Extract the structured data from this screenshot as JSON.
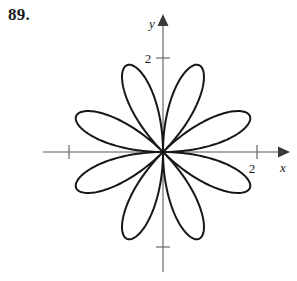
{
  "figure": {
    "problem_number": "89.",
    "background_color": "#ffffff",
    "curve_color": "#171717",
    "axis_color": "#595959",
    "text_color": "#1a1a1a"
  },
  "axes": {
    "x_axis_label": "x",
    "y_axis_label": "y",
    "x_tick_label": "2",
    "y_tick_label": "2",
    "x_tick_unlabeled_value": "-2",
    "y_tick_unlabeled_value": "-2",
    "origin_px": {
      "x": 163,
      "y": 152
    },
    "units_per_pixel": 47,
    "x_axis_start_px": 43,
    "x_axis_end_px": 282,
    "y_axis_start_px": 16,
    "y_axis_end_px": 272,
    "has_x_arrow": true,
    "has_y_arrow": true
  },
  "chart_data": {
    "type": "line",
    "subtype": "polar-rose",
    "title": "",
    "xlabel": "x",
    "ylabel": "y",
    "equation": "r = 2 sin(4θ)",
    "petal_count": 8,
    "amplitude": 2,
    "k": 4,
    "petal_angles_deg": [
      22.5,
      67.5,
      112.5,
      157.5,
      202.5,
      247.5,
      292.5,
      337.5
    ],
    "petal_tip_radius": 2.0,
    "xlim": [
      -2.55,
      2.55
    ],
    "ylim": [
      -2.55,
      2.55
    ],
    "x_ticks": [
      -2,
      2
    ],
    "y_ticks": [
      -2,
      2
    ],
    "x_tick_labels": [
      "",
      "2"
    ],
    "y_tick_labels": [
      "",
      "2"
    ],
    "grid": false,
    "legend": false,
    "theta_samples": 720,
    "r_values_sample": [
      {
        "theta_deg": 0,
        "r": 0.0
      },
      {
        "theta_deg": 5.625,
        "r": 0.765
      },
      {
        "theta_deg": 11.25,
        "r": 1.414
      },
      {
        "theta_deg": 16.875,
        "r": 1.848
      },
      {
        "theta_deg": 22.5,
        "r": 2.0
      },
      {
        "theta_deg": 28.125,
        "r": 1.848
      },
      {
        "theta_deg": 33.75,
        "r": 1.414
      },
      {
        "theta_deg": 39.375,
        "r": 0.765
      },
      {
        "theta_deg": 45,
        "r": 0.0
      },
      {
        "theta_deg": 67.5,
        "r": 2.0
      },
      {
        "theta_deg": 90,
        "r": 0.0
      },
      {
        "theta_deg": 112.5,
        "r": 2.0
      },
      {
        "theta_deg": 135,
        "r": 0.0
      },
      {
        "theta_deg": 157.5,
        "r": 2.0
      },
      {
        "theta_deg": 180,
        "r": 0.0
      },
      {
        "theta_deg": 202.5,
        "r": 2.0
      },
      {
        "theta_deg": 225,
        "r": 0.0
      },
      {
        "theta_deg": 247.5,
        "r": 2.0
      },
      {
        "theta_deg": 270,
        "r": 0.0
      },
      {
        "theta_deg": 292.5,
        "r": 2.0
      },
      {
        "theta_deg": 315,
        "r": 0.0
      },
      {
        "theta_deg": 337.5,
        "r": 2.0
      },
      {
        "theta_deg": 360,
        "r": 0.0
      }
    ]
  }
}
